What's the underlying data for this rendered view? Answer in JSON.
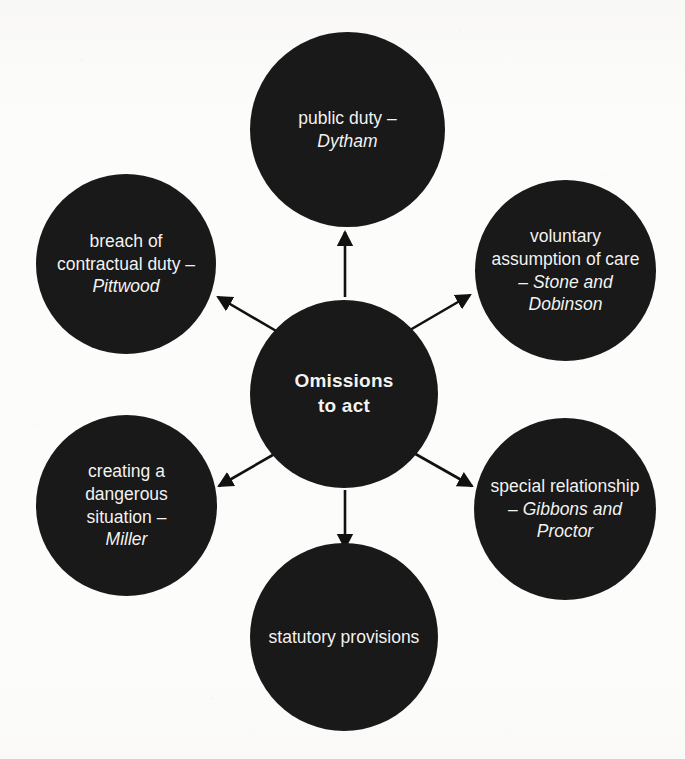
{
  "diagram": {
    "title": "Omissions to act",
    "type": "radial-spoke-diagram",
    "background_color": "#fcfcfb",
    "node_color": "#191919",
    "text_color": "#f3f3f1",
    "arrow_color": "#111111",
    "center": {
      "id": "center",
      "label": "Omissions to act",
      "line1": "Omissions",
      "line2": "to act",
      "bold": true
    },
    "nodes": [
      {
        "id": "public-duty",
        "position": "top",
        "label": "public duty – Dytham",
        "plain": "public duty –",
        "case": "Dytham"
      },
      {
        "id": "voluntary-assumption",
        "position": "top-right",
        "label": "voluntary assumption of care – Stone and Dobinson",
        "plain": "voluntary assumption of care –",
        "case": "Stone and Dobinson"
      },
      {
        "id": "special-relationship",
        "position": "bottom-right",
        "label": "special relationship – Gibbons and Proctor",
        "plain": "special relationship –",
        "case": "Gibbons and Proctor"
      },
      {
        "id": "statutory-provisions",
        "position": "bottom",
        "label": "statutory provisions",
        "plain": "statutory provisions",
        "case": ""
      },
      {
        "id": "creating-dangerous-situation",
        "position": "bottom-left",
        "label": "creating a dangerous situation – Miller",
        "plain": "creating a dangerous situation –",
        "case": "Miller"
      },
      {
        "id": "breach-contractual-duty",
        "position": "top-left",
        "label": "breach of contractual duty – Pittwood",
        "plain": "breach of contractual duty –",
        "case": "Pittwood"
      }
    ],
    "arrows": [
      {
        "id": "arrow-to-public-duty",
        "from": "center",
        "to": "public-duty",
        "direction": "up"
      },
      {
        "id": "arrow-to-voluntary",
        "from": "center",
        "to": "voluntary-assumption",
        "direction": "up-right"
      },
      {
        "id": "arrow-to-special",
        "from": "center",
        "to": "special-relationship",
        "direction": "down-right"
      },
      {
        "id": "arrow-to-statutory",
        "from": "center",
        "to": "statutory-provisions",
        "direction": "down"
      },
      {
        "id": "arrow-to-creating",
        "from": "center",
        "to": "creating-dangerous-situation",
        "direction": "down-left"
      },
      {
        "id": "arrow-to-breach",
        "from": "center",
        "to": "breach-contractual-duty",
        "direction": "up-left"
      }
    ]
  }
}
